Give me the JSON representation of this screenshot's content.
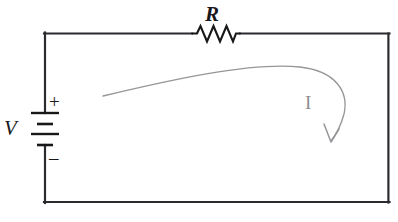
{
  "figure": {
    "type": "circuit-schematic",
    "background_color": "#ffffff",
    "width": 398,
    "height": 222
  },
  "labels": {
    "resistor": "R",
    "voltage_source": "V",
    "polarity_positive": "+",
    "polarity_negative": "–",
    "current": "I"
  },
  "colors": {
    "wire": "#2b2b2f",
    "component": "#18181a",
    "current_arrow": "#96969a",
    "current_label": "#8e8e92"
  },
  "components": {
    "loop": {
      "name": "circuit-loop-wire",
      "left": 44,
      "top": 33,
      "right": 389,
      "bottom": 203,
      "stroke_width": 2.2
    },
    "resistor": {
      "name": "resistor-zigzag",
      "orientation": "horizontal",
      "center_x": 216,
      "center_y": 34,
      "lead_start_x": 192,
      "lead_end_x": 240,
      "peaks": 6,
      "amplitude": 8
    },
    "battery": {
      "name": "battery-cell-stack",
      "orientation": "vertical",
      "center_x": 44,
      "plates": [
        {
          "y": 113,
          "half_width": 14,
          "type": "long",
          "polarity": "positive"
        },
        {
          "y": 124,
          "half_width": 8,
          "type": "short",
          "polarity": "negative"
        },
        {
          "y": 134,
          "half_width": 14,
          "type": "long",
          "polarity": "positive"
        },
        {
          "y": 145,
          "half_width": 8,
          "type": "short",
          "polarity": "negative"
        }
      ]
    },
    "current_arrow": {
      "name": "current-direction-arrow",
      "direction": "clockwise",
      "tail_x": 103,
      "tail_y": 96,
      "head_x": 331,
      "head_y": 141,
      "stroke_width": 1.3
    }
  }
}
